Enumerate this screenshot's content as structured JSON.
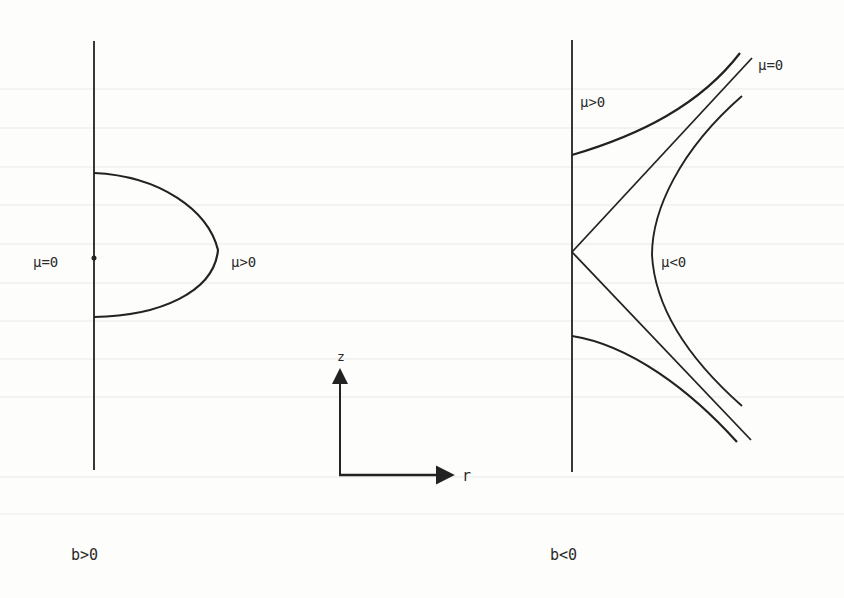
{
  "figure": {
    "panels": [
      {
        "id": "left",
        "caption": "b>0",
        "labels": {
          "axis_point": "μ=0",
          "curve": "μ>0"
        }
      },
      {
        "id": "right",
        "caption": "b<0",
        "labels": {
          "upper": "μ>0",
          "separatrix": "μ=0",
          "inner": "μ<0"
        }
      }
    ],
    "axes": {
      "vertical": "z",
      "horizontal": "r"
    },
    "colors": {
      "ink": "#222222",
      "paper": "#fdfdfc"
    }
  }
}
